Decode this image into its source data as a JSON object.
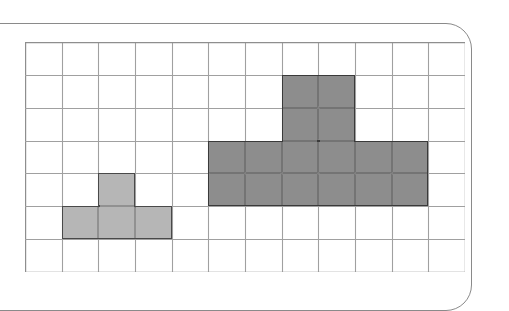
{
  "figure": {
    "kind": "grid-shape-comparison-figure",
    "border": {
      "shape": "rounded-rectangle",
      "color": "#8a8a8a",
      "corner_radius_px": 26
    }
  },
  "grid": {
    "columns": 12,
    "rows": 7,
    "cell_width_px": 36.67,
    "cell_height_px": 32.86,
    "line_color": "#8e8e8e",
    "line_color_inner": "#a0a0a0",
    "background": "#ffffff",
    "origin_x_px": 25,
    "origin_y_px": 42,
    "width_px": 440,
    "height_px": 230
  },
  "shapes": [
    {
      "name": "small-t-shape",
      "label": "light gray T shape",
      "fill": "#b6b6b6",
      "stroke": "#4f4f4f",
      "area_cells": 4,
      "perimeter_cells": 10,
      "cells": [
        {
          "col": 2,
          "row": 4
        },
        {
          "col": 1,
          "row": 5
        },
        {
          "col": 2,
          "row": 5
        },
        {
          "col": 3,
          "row": 5
        }
      ],
      "outline_segments": [
        {
          "x": 2,
          "y": 4,
          "w": 1,
          "h": 1
        },
        {
          "x": 1,
          "y": 5,
          "w": 3,
          "h": 1
        }
      ]
    },
    {
      "name": "large-t-shape",
      "label": "dark gray T shape",
      "fill": "#8d8d8d",
      "stroke": "#3a3a3a",
      "area_cells": 16,
      "perimeter_cells": 20,
      "cells": [
        {
          "col": 7,
          "row": 1
        },
        {
          "col": 8,
          "row": 1
        },
        {
          "col": 7,
          "row": 2
        },
        {
          "col": 8,
          "row": 2
        },
        {
          "col": 5,
          "row": 3
        },
        {
          "col": 6,
          "row": 3
        },
        {
          "col": 7,
          "row": 3
        },
        {
          "col": 8,
          "row": 3
        },
        {
          "col": 9,
          "row": 3
        },
        {
          "col": 10,
          "row": 3
        },
        {
          "col": 5,
          "row": 4
        },
        {
          "col": 6,
          "row": 4
        },
        {
          "col": 7,
          "row": 4
        },
        {
          "col": 8,
          "row": 4
        },
        {
          "col": 9,
          "row": 4
        },
        {
          "col": 10,
          "row": 4
        }
      ],
      "outline_segments": [
        {
          "x": 7,
          "y": 1,
          "w": 2,
          "h": 2
        },
        {
          "x": 5,
          "y": 3,
          "w": 6,
          "h": 2
        }
      ]
    }
  ],
  "chart_data": {
    "type": "table",
    "title": "",
    "xlabel": "",
    "ylabel": "",
    "grid": true,
    "categories": [
      "light gray T shape",
      "dark gray T shape"
    ],
    "values": [
      4,
      16
    ],
    "series": [
      {
        "name": "area (grid squares)",
        "values": [
          4,
          16
        ]
      },
      {
        "name": "perimeter (unit edges)",
        "values": [
          10,
          20
        ]
      },
      {
        "name": "bounding box width (cells)",
        "values": [
          3,
          6
        ]
      },
      {
        "name": "bounding box height (cells)",
        "values": [
          2,
          4
        ]
      }
    ]
  }
}
